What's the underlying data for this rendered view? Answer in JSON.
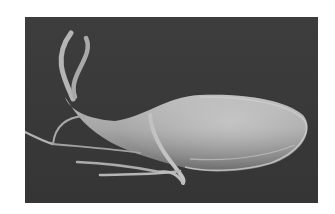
{
  "image": {
    "subject": "flagellated single-celled organism (SEM micrograph)",
    "palette": {
      "page_background": "#ffffff",
      "micrograph_background": "#3b3b3b",
      "cell_body_light": "#c8c8c8",
      "cell_body_mid": "#9a9a9a",
      "cell_body_dark": "#6a6a6a",
      "flagella": "#bdbdbd"
    }
  }
}
